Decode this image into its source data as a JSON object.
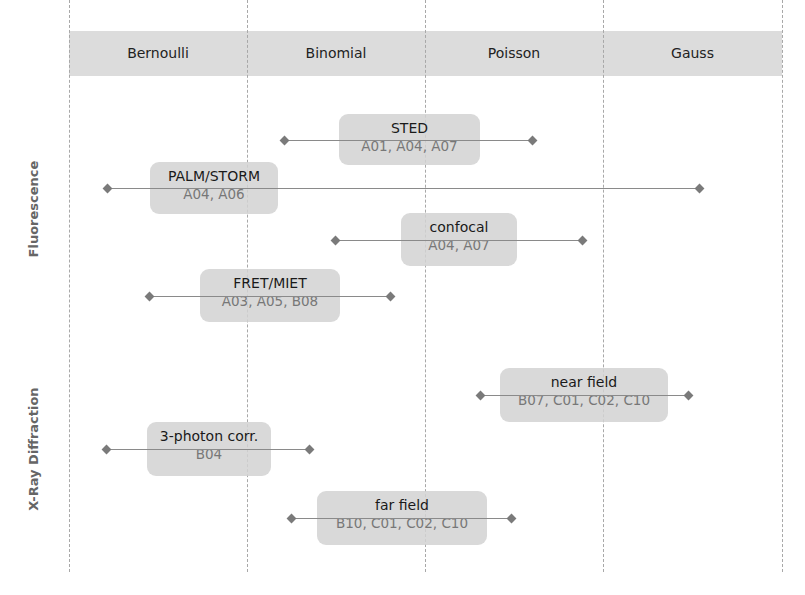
{
  "columns": [
    {
      "label": "Bernoulli"
    },
    {
      "label": "Binomial"
    },
    {
      "label": "Poisson"
    },
    {
      "label": "Gauss"
    }
  ],
  "rows": [
    {
      "label": "Fluorescence"
    },
    {
      "label": "X-Ray Diffraction"
    }
  ],
  "methods": [
    {
      "title": "STED",
      "codes": "A01, A04, A07",
      "group": "Fluorescence"
    },
    {
      "title": "PALM/STORM",
      "codes": "A04, A06",
      "group": "Fluorescence"
    },
    {
      "title": "confocal",
      "codes": "A04, A07",
      "group": "Fluorescence"
    },
    {
      "title": "FRET/MIET",
      "codes": "A03, A05, B08",
      "group": "Fluorescence"
    },
    {
      "title": "near field",
      "codes": "B07, C01, C02, C10",
      "group": "X-Ray Diffraction"
    },
    {
      "title": "3-photon corr.",
      "codes": "B04",
      "group": "X-Ray Diffraction"
    },
    {
      "title": "far field",
      "codes": "B10, C01, C02, C10",
      "group": "X-Ray Diffraction"
    }
  ],
  "colors": {
    "header_bg": "#dcdcdc",
    "card_bg": "#d2d2d2",
    "line": "#8a8a8a",
    "code_text": "#777777"
  }
}
